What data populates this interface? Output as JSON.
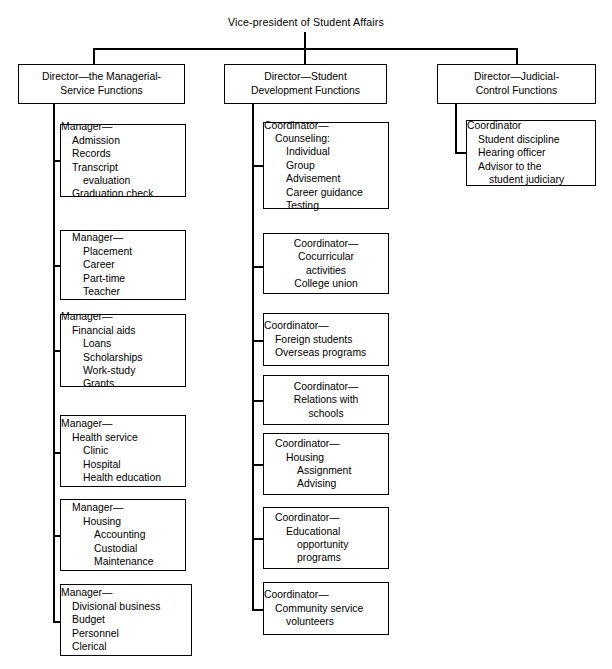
{
  "chart_title": "Vice-president of Student Affairs",
  "root": {
    "label": "Vice-president of Student Affairs"
  },
  "columns": [
    {
      "id": "managerial-service",
      "director": {
        "lines": [
          "Director—the Managerial-",
          "Service Functions"
        ]
      },
      "units": [
        {
          "id": "admission-records",
          "lines": [
            {
              "text": "Manager—",
              "indent": 0
            },
            {
              "text": "Admission",
              "indent": 1
            },
            {
              "text": "Records",
              "indent": 1
            },
            {
              "text": "Transcript",
              "indent": 1
            },
            {
              "text": "evaluation",
              "indent": 2
            },
            {
              "text": "Graduation check",
              "indent": 1
            }
          ]
        },
        {
          "id": "placement-career",
          "lines": [
            {
              "text": "Manager—",
              "indent": 0
            },
            {
              "text": "Placement",
              "indent": 1
            },
            {
              "text": "Career",
              "indent": 1
            },
            {
              "text": "Part-time",
              "indent": 1
            },
            {
              "text": "Teacher",
              "indent": 1
            }
          ]
        },
        {
          "id": "financial-aids",
          "lines": [
            {
              "text": "Manager—",
              "indent": 0
            },
            {
              "text": "Financial aids",
              "indent": 1
            },
            {
              "text": "Loans",
              "indent": 2
            },
            {
              "text": "Scholarships",
              "indent": 2
            },
            {
              "text": "Work-study",
              "indent": 2
            },
            {
              "text": "Grants",
              "indent": 2
            }
          ]
        },
        {
          "id": "health-service",
          "lines": [
            {
              "text": "Manager—",
              "indent": 0
            },
            {
              "text": "Health service",
              "indent": 1
            },
            {
              "text": "Clinic",
              "indent": 2
            },
            {
              "text": "Hospital",
              "indent": 2
            },
            {
              "text": "Health education",
              "indent": 2
            }
          ]
        },
        {
          "id": "housing-accounting",
          "lines": [
            {
              "text": "Manager—",
              "indent": 0
            },
            {
              "text": "Housing",
              "indent": 1
            },
            {
              "text": "Accounting",
              "indent": 2
            },
            {
              "text": "Custodial",
              "indent": 2
            },
            {
              "text": "Maintenance",
              "indent": 2
            }
          ]
        },
        {
          "id": "divisional-business",
          "lines": [
            {
              "text": "Manager—",
              "indent": 0
            },
            {
              "text": "Divisional business",
              "indent": 1
            },
            {
              "text": "Budget",
              "indent": 1
            },
            {
              "text": "Personnel",
              "indent": 1
            },
            {
              "text": "Clerical",
              "indent": 1
            }
          ]
        }
      ]
    },
    {
      "id": "student-development",
      "director": {
        "lines": [
          "Director—Student",
          "Development Functions"
        ]
      },
      "units": [
        {
          "id": "counseling",
          "lines": [
            {
              "text": "Coordinator—",
              "indent": 0
            },
            {
              "text": "Counseling:",
              "indent": 1
            },
            {
              "text": "Individual",
              "indent": 2
            },
            {
              "text": "Group",
              "indent": 2
            },
            {
              "text": "Advisement",
              "indent": 2
            },
            {
              "text": "Career guidance",
              "indent": 2
            },
            {
              "text": "Testing",
              "indent": 2
            }
          ]
        },
        {
          "id": "cocurricular",
          "centered": true,
          "lines": [
            {
              "text": "Coordinator—",
              "indent": 0
            },
            {
              "text": "Cocurricular",
              "indent": 0
            },
            {
              "text": "activities",
              "indent": 0
            },
            {
              "text": "College union",
              "indent": 0
            }
          ]
        },
        {
          "id": "foreign-students",
          "lines": [
            {
              "text": "Coordinator—",
              "indent": 0
            },
            {
              "text": "Foreign students",
              "indent": 1
            },
            {
              "text": "Overseas programs",
              "indent": 1
            }
          ]
        },
        {
          "id": "relations-with-schools",
          "centered": true,
          "lines": [
            {
              "text": "Coordinator—",
              "indent": 0
            },
            {
              "text": "Relations with",
              "indent": 0
            },
            {
              "text": "schools",
              "indent": 0
            }
          ]
        },
        {
          "id": "housing-assignment",
          "lines": [
            {
              "text": "Coordinator—",
              "indent": 0
            },
            {
              "text": "Housing",
              "indent": 1
            },
            {
              "text": "Assignment",
              "indent": 2
            },
            {
              "text": "Advising",
              "indent": 2
            }
          ]
        },
        {
          "id": "educational-opportunity",
          "lines": [
            {
              "text": "Coordinator—",
              "indent": 0
            },
            {
              "text": "Educational",
              "indent": 1
            },
            {
              "text": "opportunity",
              "indent": 2
            },
            {
              "text": "programs",
              "indent": 2
            }
          ]
        },
        {
          "id": "community-service",
          "lines": [
            {
              "text": "Coordinator—",
              "indent": 0
            },
            {
              "text": "Community service",
              "indent": 1
            },
            {
              "text": "volunteers",
              "indent": 2
            }
          ]
        }
      ]
    },
    {
      "id": "judicial-control",
      "director": {
        "lines": [
          "Director—Judicial-",
          "Control Functions"
        ]
      },
      "units": [
        {
          "id": "student-discipline",
          "lines": [
            {
              "text": "Coordinator",
              "indent": 0
            },
            {
              "text": "Student discipline",
              "indent": 1
            },
            {
              "text": "Hearing officer",
              "indent": 1
            },
            {
              "text": "Advisor to the",
              "indent": 1
            },
            {
              "text": "student judiciary",
              "indent": 2
            }
          ]
        }
      ]
    }
  ],
  "colors": {
    "line": "#000000",
    "background": "#ffffff",
    "text": "#000000"
  }
}
